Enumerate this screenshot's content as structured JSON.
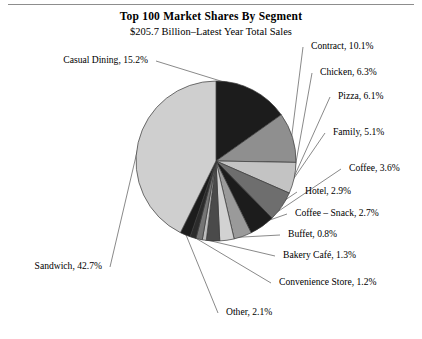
{
  "header": {
    "title": "Top 100 Market Shares By Segment",
    "subtitle": "$205.7 Billion–Latest Year Total Sales"
  },
  "chart_data": {
    "type": "pie",
    "title": "Top 100 Market Shares By Segment",
    "subtitle": "$205.7 Billion–Latest Year Total Sales",
    "xlabel": "",
    "ylabel": "",
    "units": "percent",
    "total_sales": "$205.7 Billion",
    "legend_position": "callout-labels",
    "grid": false,
    "start_angle_deg": -90,
    "direction": "clockwise",
    "categories": [
      "Casual Dining",
      "Contract",
      "Chicken",
      "Pizza",
      "Family",
      "Coffee",
      "Hotel",
      "Coffee – Snack",
      "Buffet",
      "Bakery Café",
      "Convenience Store",
      "Other",
      "Sandwich"
    ],
    "values": [
      15.2,
      10.1,
      6.3,
      6.1,
      5.1,
      3.6,
      2.9,
      2.7,
      0.8,
      1.3,
      1.2,
      2.1,
      42.7
    ],
    "slices": [
      {
        "label": "Casual Dining",
        "value": 15.2,
        "text": "Casual Dining, 15.2%",
        "color": "#1c1c1c"
      },
      {
        "label": "Contract",
        "value": 10.1,
        "text": "Contract, 10.1%",
        "color": "#8f8f8f"
      },
      {
        "label": "Chicken",
        "value": 6.3,
        "text": "Chicken, 6.3%",
        "color": "#c3c3c3"
      },
      {
        "label": "Pizza",
        "value": 6.1,
        "text": "Pizza, 6.1%",
        "color": "#6e6e6e"
      },
      {
        "label": "Family",
        "value": 5.1,
        "text": "Family, 5.1%",
        "color": "#1c1c1c"
      },
      {
        "label": "Coffee",
        "value": 3.6,
        "text": "Coffee, 3.6%",
        "color": "#9a9a9a"
      },
      {
        "label": "Hotel",
        "value": 2.9,
        "text": "Hotel, 2.9%",
        "color": "#d2d2d2"
      },
      {
        "label": "Coffee – Snack",
        "value": 2.7,
        "text": "Coffee – Snack, 2.7%",
        "color": "#4a4a4a"
      },
      {
        "label": "Buffet",
        "value": 0.8,
        "text": "Buffet, 0.8%",
        "color": "#bdbdbd"
      },
      {
        "label": "Bakery Café",
        "value": 1.3,
        "text": "Bakery Café, 1.3%",
        "color": "#757575"
      },
      {
        "label": "Convenience Store",
        "value": 1.2,
        "text": "Convenience Store, 1.2%",
        "color": "#2b2b2b"
      },
      {
        "label": "Other",
        "value": 2.1,
        "text": "Other, 2.1%",
        "color": "#1c1c1c"
      },
      {
        "label": "Sandwich",
        "value": 42.7,
        "text": "Sandwich, 42.7%",
        "color": "#cfcfcf"
      }
    ],
    "colors": {
      "outline": "#3a3a3a",
      "leader_line": "#6b6b6b",
      "background": "#ffffff",
      "text": "#000000"
    }
  }
}
